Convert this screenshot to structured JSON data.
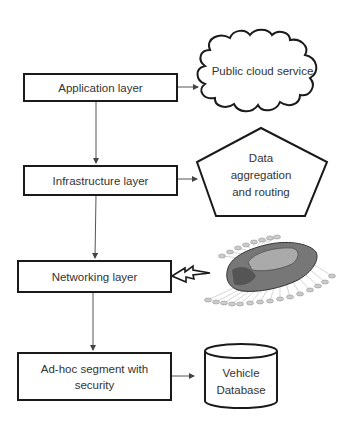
{
  "diagram": {
    "layers": [
      {
        "id": "application",
        "label": "Application layer"
      },
      {
        "id": "infrastructure",
        "label": "Infrastructure layer"
      },
      {
        "id": "networking",
        "label": "Networking layer"
      },
      {
        "id": "adhoc",
        "label": "Ad-hoc segment with security"
      }
    ],
    "targets": {
      "cloud": {
        "label": "Public cloud service",
        "shape": "cloud"
      },
      "pentagon": {
        "line1": "Data",
        "line2": "aggregation",
        "line3": "and routing",
        "shape": "pentagon"
      },
      "car": {
        "shape": "vehicle-with-sensors-image",
        "icon": "car-sensor-icon"
      },
      "database": {
        "line1": "Vehicle",
        "line2": "Database",
        "shape": "cylinder"
      }
    },
    "connectors": {
      "vertical": [
        "application->infrastructure",
        "infrastructure->networking",
        "networking->adhoc"
      ],
      "horizontal": [
        "application->cloud",
        "infrastructure->pentagon",
        "networking~car (wireless)",
        "adhoc->database"
      ]
    },
    "colors": {
      "stroke": "#1a1a1a",
      "line": "#555555",
      "background": "#ffffff"
    }
  }
}
